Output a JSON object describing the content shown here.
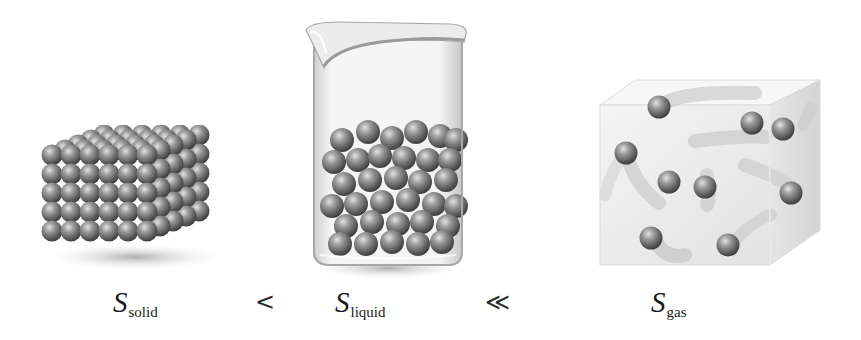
{
  "figure": {
    "panels": [
      {
        "id": "solid",
        "description": "ordered cubic lattice of spheres"
      },
      {
        "id": "liquid",
        "description": "beaker containing randomly packed spheres"
      },
      {
        "id": "gas",
        "description": "transparent box with few widely spaced moving spheres"
      }
    ],
    "labels": {
      "solid": {
        "symbol": "S",
        "subscript": "solid"
      },
      "liquid": {
        "symbol": "S",
        "subscript": "liquid"
      },
      "gas": {
        "symbol": "S",
        "subscript": "gas"
      }
    },
    "relations": {
      "solid_liquid": "<",
      "liquid_gas": "≪"
    },
    "colors": {
      "sphere_dark": "#4a4a4a",
      "sphere_mid": "#8a8a8a",
      "sphere_light": "#d8d8d8",
      "glass": "#e6e6e6",
      "text": "#1a1a1a"
    }
  }
}
